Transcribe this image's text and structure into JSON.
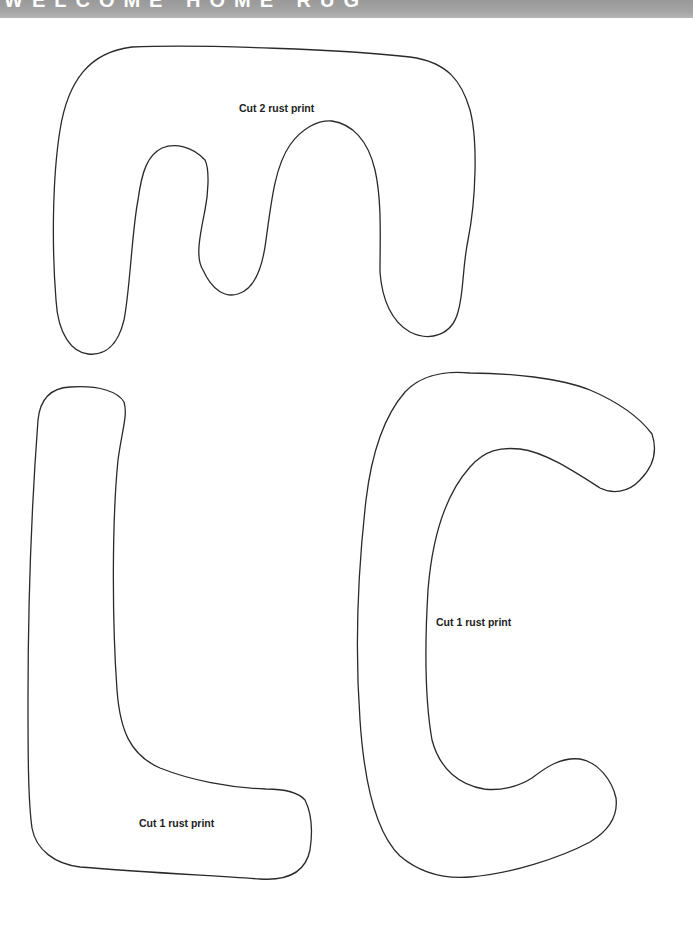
{
  "header": {
    "title": "WELCOME HOME RUG"
  },
  "pieces": [
    {
      "letter": "M",
      "label": "Cut 2 rust print"
    },
    {
      "letter": "C",
      "label": "Cut 1 rust print"
    },
    {
      "letter": "L",
      "label": "Cut 1 rust print"
    }
  ],
  "colors": {
    "header_band": "#a3a3a3",
    "header_text": "#ffffff",
    "outline": "#2a2a2a",
    "label_text": "#222222",
    "background": "#ffffff"
  }
}
